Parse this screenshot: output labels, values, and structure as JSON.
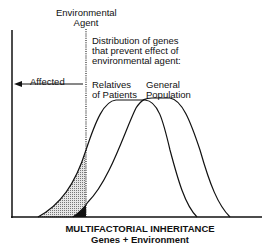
{
  "diagram": {
    "title": "MULTIFACTORIAL INHERITANCE",
    "subtitle": "Genes + Environment",
    "threshold_label": [
      "Environmental",
      "Agent"
    ],
    "distribution_caption": [
      "Distribution of genes",
      "that prevent effect of",
      "environmental agent:"
    ],
    "affected_label": "Affected",
    "curves": [
      {
        "name": "Relatives of Patients",
        "label_lines": [
          "Relatives",
          "of Patients"
        ]
      },
      {
        "name": "General Population",
        "label_lines": [
          "General",
          "Population"
        ]
      }
    ],
    "colors": {
      "line": "#111111",
      "shading_relatives": "#bdbdbd",
      "shading_general": "#111111"
    }
  }
}
